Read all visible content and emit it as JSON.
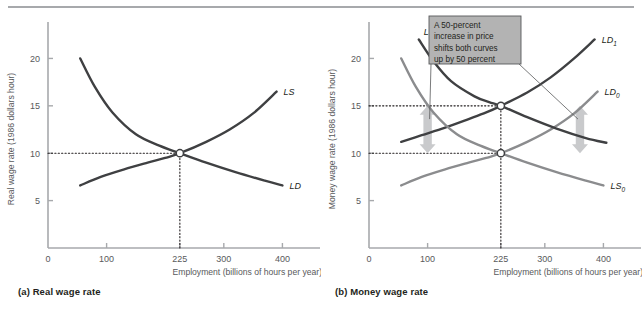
{
  "figure": {
    "panels": [
      {
        "id": "a",
        "caption": "(a) Real wage rate",
        "ylabel": "Real wage rate (1986 dollars hour)",
        "xlabel": "Employment (billions of hours per year)"
      },
      {
        "id": "b",
        "caption": "(b) Money wage rate",
        "ylabel": "Money wage rate (1986 dollars hour)",
        "xlabel": "Employment (billions of hours per year)"
      }
    ],
    "annotation": {
      "line1": "A 50-percent",
      "line2": "increase in price",
      "line3": "shifts both curves",
      "line4": "up by 50 percent",
      "box_fill": "#b3b3b3",
      "box_stroke": "#58595b"
    },
    "colors": {
      "dark_curve": "#3f4042",
      "light_curve": "#8b8c8e",
      "axis": "#a7a9ac",
      "arrow": "#c9cacc",
      "text": "#58595b",
      "dotted": "#231f20"
    }
  },
  "chart_data": [
    {
      "type": "line",
      "panel": "a",
      "title": "(a) Real wage rate",
      "xlabel": "Employment (billions of hours per year)",
      "ylabel": "Real wage rate (1986 dollars hour)",
      "xlim": [
        0,
        430
      ],
      "ylim": [
        0,
        23
      ],
      "xticks": [
        0,
        100,
        225,
        300,
        400
      ],
      "xtick_labels": [
        "0",
        "100",
        "225",
        "300",
        "400"
      ],
      "yticks": [
        5,
        10,
        15,
        20
      ],
      "ytick_labels": [
        "5",
        "10",
        "15",
        "20"
      ],
      "grid": false,
      "legend": "inline-curve-labels",
      "equilibrium": {
        "x": 225,
        "y": 10,
        "marker": "open-circle"
      },
      "guides": [
        {
          "type": "horizontal-dotted",
          "y": 10,
          "from_x": 0,
          "to_x": 225
        },
        {
          "type": "vertical-dotted",
          "x": 225,
          "from_y": 0,
          "to_y": 10
        }
      ],
      "series": [
        {
          "name": "LD",
          "label": "LD",
          "color": "#3f4042",
          "points": [
            [
              55,
              20.0
            ],
            [
              80,
              17.0
            ],
            [
              110,
              14.3
            ],
            [
              150,
              12.0
            ],
            [
              190,
              10.8
            ],
            [
              225,
              10.0
            ],
            [
              270,
              9.0
            ],
            [
              320,
              8.0
            ],
            [
              370,
              7.1
            ],
            [
              400,
              6.6
            ]
          ]
        },
        {
          "name": "LS",
          "label": "LS",
          "color": "#3f4042",
          "points": [
            [
              55,
              6.6
            ],
            [
              90,
              7.5
            ],
            [
              130,
              8.3
            ],
            [
              170,
              9.0
            ],
            [
              200,
              9.5
            ],
            [
              225,
              10.0
            ],
            [
              270,
              11.2
            ],
            [
              310,
              12.5
            ],
            [
              350,
              14.2
            ],
            [
              390,
              16.5
            ]
          ]
        }
      ]
    },
    {
      "type": "line",
      "panel": "b",
      "title": "(b) Money wage rate",
      "xlabel": "Employment (billions of hours per year)",
      "ylabel": "Money wage rate (1986 dollars hour)",
      "xlim": [
        0,
        430
      ],
      "ylim": [
        0,
        23
      ],
      "xticks": [
        0,
        100,
        225,
        300,
        400
      ],
      "xtick_labels": [
        "0",
        "100",
        "225",
        "300",
        "400"
      ],
      "yticks": [
        5,
        10,
        15,
        20
      ],
      "ytick_labels": [
        "5",
        "10",
        "15",
        "20"
      ],
      "grid": false,
      "legend": "inline-curve-labels",
      "equilibria": [
        {
          "x": 225,
          "y": 15,
          "marker": "open-circle",
          "label": "new equilibrium"
        },
        {
          "x": 225,
          "y": 10,
          "marker": "open-circle",
          "label": "original equilibrium"
        }
      ],
      "guides": [
        {
          "type": "horizontal-dotted",
          "y": 15,
          "from_x": 0,
          "to_x": 225
        },
        {
          "type": "horizontal-dotted",
          "y": 10,
          "from_x": 0,
          "to_x": 225
        },
        {
          "type": "vertical-dotted",
          "x": 225,
          "from_y": 0,
          "to_y": 15
        }
      ],
      "annotation_arrows": [
        {
          "x": 100,
          "from_y": 10,
          "to_y": 15,
          "direction": "double",
          "color": "#c9cacc"
        },
        {
          "x": 360,
          "from_y": 10,
          "to_y": 15,
          "direction": "double",
          "color": "#c9cacc"
        }
      ],
      "series": [
        {
          "name": "LD0",
          "label": "LD",
          "sublabel": "0",
          "color": "#8b8c8e",
          "points": [
            [
              55,
              6.6
            ],
            [
              90,
              7.5
            ],
            [
              130,
              8.3
            ],
            [
              170,
              9.0
            ],
            [
              200,
              9.5
            ],
            [
              225,
              10.0
            ],
            [
              270,
              11.2
            ],
            [
              310,
              12.5
            ],
            [
              350,
              14.2
            ],
            [
              390,
              16.5
            ]
          ]
        },
        {
          "name": "LD1",
          "label": "LD",
          "sublabel": "1",
          "color": "#3f4042",
          "points": [
            [
              55,
              11.2
            ],
            [
              90,
              11.9
            ],
            [
              130,
              12.7
            ],
            [
              170,
              13.6
            ],
            [
              200,
              14.3
            ],
            [
              225,
              15.0
            ],
            [
              270,
              16.4
            ],
            [
              310,
              18.0
            ],
            [
              350,
              20.0
            ],
            [
              385,
              22.0
            ]
          ]
        },
        {
          "name": "LS0",
          "label": "LS",
          "sublabel": "0",
          "color": "#8b8c8e",
          "points": [
            [
              55,
              20.0
            ],
            [
              80,
              17.0
            ],
            [
              110,
              14.3
            ],
            [
              150,
              12.0
            ],
            [
              190,
              10.8
            ],
            [
              225,
              10.0
            ],
            [
              270,
              9.0
            ],
            [
              320,
              8.0
            ],
            [
              370,
              7.1
            ],
            [
              400,
              6.6
            ]
          ]
        },
        {
          "name": "LS1",
          "label": "LS",
          "sublabel": "1",
          "color": "#3f4042",
          "points": [
            [
              85,
              22.0
            ],
            [
              110,
              19.7
            ],
            [
              140,
              17.6
            ],
            [
              180,
              16.0
            ],
            [
              205,
              15.4
            ],
            [
              225,
              15.0
            ],
            [
              270,
              13.8
            ],
            [
              320,
              12.6
            ],
            [
              370,
              11.6
            ],
            [
              405,
              11.1
            ]
          ]
        }
      ],
      "annotation": {
        "text": "A 50-percent increase in price shifts both curves up by 50 percent",
        "lines": [
          "A 50-percent",
          "increase in price",
          "shifts both curves",
          "up by 50 percent"
        ]
      }
    }
  ]
}
